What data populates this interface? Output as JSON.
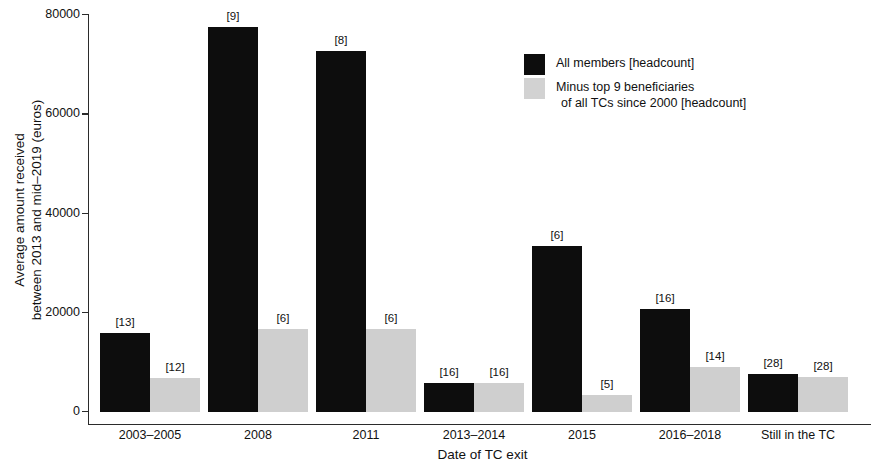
{
  "chart_data": {
    "type": "bar",
    "title": "",
    "xlabel": "Date of TC exit",
    "ylabel": "Average amount received\nbetween 2013 and mid–2019 (euros)",
    "ylabel_line1": "Average amount received",
    "ylabel_line2": "between 2013 and mid–2019 (euros)",
    "categories": [
      "2003–2005",
      "2008",
      "2011",
      "2013–2014",
      "2015",
      "2016–2018",
      "Still in the TC"
    ],
    "ylim": [
      0,
      80000
    ],
    "yticks": [
      0,
      20000,
      40000,
      60000,
      80000
    ],
    "ytick_labels": [
      "0",
      "20000",
      "40000",
      "60000",
      "80000"
    ],
    "grid": false,
    "legend_position": "top-right",
    "series": [
      {
        "name": "All members [headcount]",
        "color": "#0d0d0d",
        "values": [
          16000,
          77500,
          72700,
          5900,
          33500,
          20800,
          7700
        ],
        "point_labels": [
          "[13]",
          "[9]",
          "[8]",
          "[16]",
          "[6]",
          "[16]",
          "[28]"
        ]
      },
      {
        "name": "Minus top 9 beneficiaries of all TCs since 2000 [headcount]",
        "color": "#cfcfcf",
        "values": [
          6800,
          16800,
          16800,
          5900,
          3500,
          9100,
          7100
        ],
        "point_labels": [
          "[12]",
          "[6]",
          "[6]",
          "[16]",
          "[5]",
          "[14]",
          "[28]"
        ]
      }
    ]
  },
  "legend": {
    "entries": [
      {
        "label": "All members [headcount]",
        "sublabel": "",
        "swatch": "black"
      },
      {
        "label": "Minus top 9 beneficiaries",
        "sublabel": "of all TCs since 2000 [headcount]",
        "swatch": "gray"
      }
    ]
  }
}
